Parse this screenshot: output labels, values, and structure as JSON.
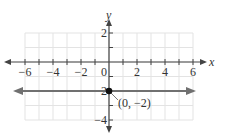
{
  "chart_data": {
    "type": "line",
    "title": "",
    "xlabel": "x",
    "ylabel": "y",
    "xlim": [
      -6,
      6
    ],
    "ylim": [
      -4,
      2
    ],
    "grid": true,
    "x_ticks": [
      -6,
      -4,
      -2,
      0,
      2,
      4,
      6
    ],
    "x_tick_labels": [
      "−6",
      "−4",
      "−2",
      "0",
      "2",
      "4",
      "6"
    ],
    "y_ticks": [
      2,
      -2,
      -4
    ],
    "y_tick_labels": [
      "2",
      "−2",
      "−4"
    ],
    "series": [
      {
        "name": "y = -2",
        "equation": "y = -2",
        "x": [
          -6,
          6
        ],
        "y": [
          -2,
          -2
        ],
        "color": "#707070",
        "arrows_both_ends": true
      }
    ],
    "points": [
      {
        "x": 0,
        "y": -2,
        "label": "(0, −2)",
        "color": "#111111"
      }
    ],
    "annotations": [
      {
        "text": "(0, −2)",
        "x": 0,
        "y": -2
      }
    ]
  },
  "colors": {
    "grid": "#e3e3e3",
    "axis": "#444444",
    "line": "#707070",
    "point": "#111111"
  }
}
